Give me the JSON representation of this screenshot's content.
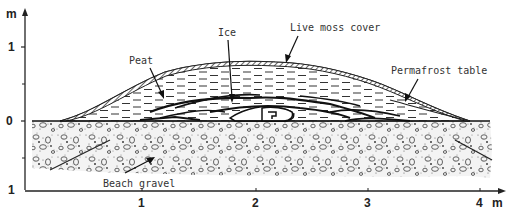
{
  "figure": {
    "type": "cross-section",
    "y_axis": {
      "unit": "m",
      "ticks": [
        "1",
        "0",
        "1"
      ]
    },
    "x_axis": {
      "unit": "m",
      "ticks": [
        "1",
        "2",
        "3",
        "4"
      ]
    },
    "labels": {
      "ice": "Ice",
      "live_moss_cover": "Live moss cover",
      "peat": "Peat",
      "permafrost_table": "Permafrost table",
      "beach_gravel": "Beach gravel"
    }
  }
}
